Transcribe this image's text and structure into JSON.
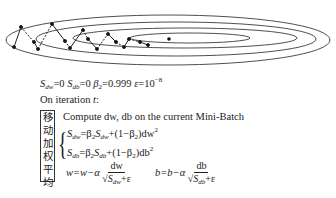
{
  "diagram": {
    "type": "gradient-descent-contour",
    "contours": [
      {
        "cx": 168,
        "cy": 40,
        "rx": 162,
        "ry": 25
      },
      {
        "cx": 176,
        "cy": 39,
        "rx": 140,
        "ry": 17
      },
      {
        "cx": 185,
        "cy": 38,
        "rx": 112,
        "ry": 10
      },
      {
        "cx": 190,
        "cy": 38,
        "rx": 60,
        "ry": 5
      }
    ],
    "minimum": {
      "x": 169,
      "y": 39
    },
    "path_points": [
      [
        14,
        47
      ],
      [
        21,
        27
      ],
      [
        34,
        42
      ],
      [
        38,
        49
      ],
      [
        52,
        24
      ],
      [
        65,
        41
      ],
      [
        70,
        48
      ],
      [
        83,
        30
      ],
      [
        88,
        39
      ],
      [
        97,
        49
      ],
      [
        108,
        34
      ],
      [
        116,
        42
      ],
      [
        124,
        47
      ],
      [
        129,
        39
      ],
      [
        140,
        42
      ],
      [
        148,
        45
      ]
    ],
    "colors": {
      "stroke": "#222222",
      "background": "#ffffff"
    }
  },
  "text": {
    "params": {
      "S_dw": "S",
      "S_dw_sub": "dw",
      "S_dw_val": "=0 ",
      "S_db": "S",
      "S_db_sub": "db",
      "S_db_val": "=0 ",
      "beta2": "β",
      "beta2_sub": "2",
      "beta2_val": "=0.999 ",
      "eps": "ε",
      "eps_val": "=10",
      "eps_exp": "−8"
    },
    "iteration": "On iteration ",
    "iteration_var": "t",
    "iteration_colon": ":",
    "compute": "Compute dw, db on the current Mini-Batch",
    "side_label": [
      "移",
      "动",
      "加",
      "权",
      "平",
      "均"
    ],
    "brace": "{",
    "eq1": {
      "lhs": "S",
      "lhs_sub": "dw",
      "mid": "=β",
      "b2": "2",
      "s": "S",
      "s_sub": "dw",
      "rest": "+(1−β",
      "b2b": "2",
      "tail": ")dw",
      "sq": "2"
    },
    "eq2": {
      "lhs": "S",
      "lhs_sub": "db",
      "mid": "=β",
      "b2": "2",
      "s": "S",
      "s_sub": "db",
      "rest": "+(1−β",
      "b2b": "2",
      "tail": ")db",
      "sq": "2"
    },
    "update_w": {
      "lhs": "w=w−α ",
      "num": "dw",
      "den_root": "√S",
      "den_sub": "dw",
      "den_tail": "+ε"
    },
    "update_b": {
      "lhs": "b=b−α ",
      "num": "db",
      "den_root": "√S",
      "den_sub": "db",
      "den_tail": "+ε"
    }
  }
}
